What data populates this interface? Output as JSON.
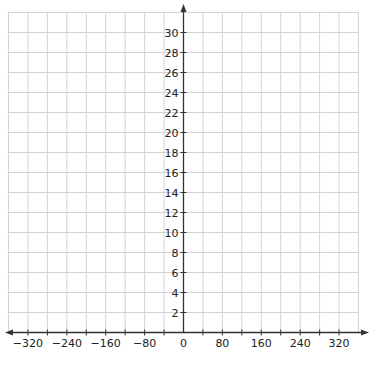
{
  "chart_data": {
    "type": "line",
    "title": "",
    "xlabel": "",
    "ylabel": "",
    "xlim": [
      -360,
      360
    ],
    "ylim": [
      0,
      32
    ],
    "grid": true,
    "x_grid_step": 40,
    "y_grid_step": 2,
    "x_tick_labels": [
      "−320",
      "−240",
      "−160",
      "−80",
      "0",
      "80",
      "160",
      "240",
      "320"
    ],
    "x_tick_values": [
      -320,
      -240,
      -160,
      -80,
      0,
      80,
      160,
      240,
      320
    ],
    "y_tick_labels": [
      "2",
      "4",
      "6",
      "8",
      "10",
      "12",
      "14",
      "16",
      "18",
      "20",
      "22",
      "24",
      "26",
      "28",
      "30"
    ],
    "y_tick_values": [
      2,
      4,
      6,
      8,
      10,
      12,
      14,
      16,
      18,
      20,
      22,
      24,
      26,
      28,
      30
    ],
    "series": [],
    "legend": null
  },
  "colors": {
    "grid": "#d4d4d4",
    "axis": "#333333",
    "label": "#222222"
  }
}
